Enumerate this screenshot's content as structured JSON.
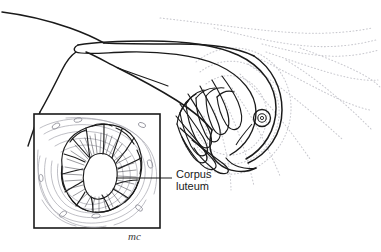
{
  "figure": {
    "background_color": "#ffffff",
    "ink_color": "#1a1a1a",
    "ghost_color": "#c9c9cf",
    "stroma_color": "#9a9aa2"
  },
  "labels": {
    "corpus_luteum_line1": "Corpus",
    "corpus_luteum_line2": "luteum"
  },
  "signature": {
    "artist_initials": "mc"
  },
  "structures": {
    "fallopian_tube": "fallopian-tube",
    "mesosalpinx": "mesosalpinx",
    "ovary": "ovary",
    "fimbriae": "fimbriae",
    "ovum": "ovum",
    "ghost_fimbriae": "ghost-fimbriae",
    "inset_box": "inset-detail-box",
    "corpus_luteum": "corpus-luteum",
    "leader_line": "leader-line"
  }
}
